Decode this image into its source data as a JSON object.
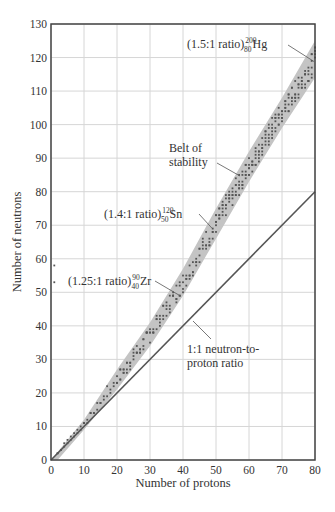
{
  "chart_data": {
    "type": "scatter",
    "title": "",
    "xlabel": "Number of protons",
    "ylabel": "Number of neutrons",
    "xlim": [
      0,
      80
    ],
    "ylim": [
      0,
      130
    ],
    "xticks": [
      0,
      10,
      20,
      30,
      40,
      50,
      60,
      70,
      80
    ],
    "yticks": [
      0,
      10,
      20,
      30,
      40,
      50,
      60,
      70,
      80,
      90,
      100,
      110,
      120,
      130
    ],
    "grid": true,
    "colors": {
      "belt": "#c4c4c4",
      "dots": "#555555",
      "line": "#555555",
      "grid": "#d6d6d6",
      "axis": "#444444"
    },
    "belt_of_stability": {
      "label": "Belt of stability",
      "upper": [
        [
          0,
          0
        ],
        [
          10,
          12
        ],
        [
          20,
          27
        ],
        [
          30,
          41
        ],
        [
          40,
          57
        ],
        [
          50,
          75
        ],
        [
          60,
          92
        ],
        [
          70,
          108
        ],
        [
          80,
          125
        ]
      ],
      "lower": [
        [
          80,
          114
        ],
        [
          70,
          99
        ],
        [
          60,
          83
        ],
        [
          50,
          66
        ],
        [
          40,
          49
        ],
        [
          30,
          34
        ],
        [
          20,
          21
        ],
        [
          10,
          9
        ],
        [
          2,
          0
        ]
      ]
    },
    "series": [
      {
        "name": "1:1 neutron-to-proton ratio",
        "type": "line",
        "x": [
          0,
          80
        ],
        "y": [
          0,
          80
        ]
      }
    ],
    "annotations": [
      {
        "text_prefix": "(1.5:1 ratio)",
        "mass": "200",
        "atomic": "80",
        "symbol": "Hg",
        "point": [
          80,
          120
        ]
      },
      {
        "text_prefix": "(1.4:1 ratio)",
        "mass": "120",
        "atomic": "50",
        "symbol": "Sn",
        "point": [
          50,
          70
        ]
      },
      {
        "text_prefix": "(1.25:1 ratio)",
        "mass": "90",
        "atomic": "40",
        "symbol": "Zr",
        "point": [
          40,
          50
        ]
      },
      {
        "text": [
          "Belt of",
          "stability"
        ],
        "point": [
          57,
          84
        ]
      },
      {
        "text": [
          "1:1 neutron-to-",
          "proton ratio"
        ],
        "point": [
          42,
          42
        ]
      }
    ]
  }
}
